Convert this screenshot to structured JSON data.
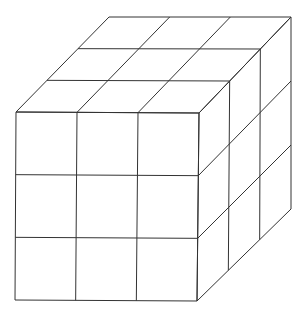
{
  "diagram": {
    "title": "",
    "type": "3x3x3 cube (isometric line drawing)",
    "grid_divisions": 3,
    "stroke_color": "#333333",
    "background": "#ffffff",
    "vertices": {
      "front_top_left": [
        16,
        112
      ],
      "front_top_right": [
        199,
        113
      ],
      "front_bottom_left": [
        15,
        300
      ],
      "front_bottom_right": [
        197,
        301
      ],
      "back_top_left": [
        109,
        17
      ],
      "back_top_right": [
        291,
        17
      ],
      "back_bottom_right": [
        291,
        209
      ]
    }
  }
}
